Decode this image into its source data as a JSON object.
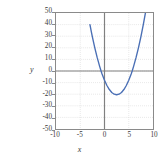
{
  "chart_data": {
    "type": "line",
    "title": "",
    "xlabel": "x",
    "ylabel": "y",
    "xlim": [
      -10,
      10
    ],
    "ylim": [
      -50,
      50
    ],
    "xticks": [
      -10,
      -5,
      0,
      5,
      10
    ],
    "yticks": [
      50,
      40,
      30,
      20,
      10,
      0,
      -10,
      -20,
      -30,
      -40,
      -50
    ],
    "xtick_labels": [
      "-10",
      "-5",
      "0",
      "5",
      "10"
    ],
    "ytick_labels": [
      "50",
      "40",
      "30",
      "20",
      "10",
      "0",
      "-10",
      "-20",
      "-30",
      "-40",
      "-50"
    ],
    "grid": true,
    "grid_style": "dotted",
    "legend": "none",
    "series": [
      {
        "name": "parabola",
        "color": "#4a6fb5",
        "linewidth": 1.4,
        "equation": "y = 2x^2 - 10x - 8",
        "vertex": [
          2.5,
          -20.5
        ],
        "roots": [
          -0.71,
          5.71
        ],
        "x": [
          -3.0,
          -2.7,
          -2.5,
          -2.0,
          -1.5,
          -1.0,
          -0.71,
          -0.5,
          0.0,
          0.5,
          1.0,
          1.5,
          2.0,
          2.5,
          3.0,
          3.5,
          4.0,
          4.5,
          5.0,
          5.5,
          5.71,
          6.0,
          6.5,
          7.0,
          7.5,
          8.0,
          8.5,
          8.62,
          9.0
        ],
        "y": [
          40.0,
          33.6,
          29.5,
          20.0,
          11.5,
          4.0,
          0.0,
          -2.5,
          -8.0,
          -12.5,
          -16.0,
          -18.5,
          -20.0,
          -20.5,
          -20.0,
          -18.5,
          -16.0,
          -12.5,
          -8.0,
          -2.5,
          0.0,
          4.0,
          11.5,
          20.0,
          29.5,
          40.0,
          51.5,
          55.0,
          64.0
        ]
      }
    ]
  },
  "axes": {
    "zero_line_color": "#808080",
    "frame_color": "#8a8a8a",
    "grid_color": "#c9c9c9",
    "background": "#ffffff"
  }
}
